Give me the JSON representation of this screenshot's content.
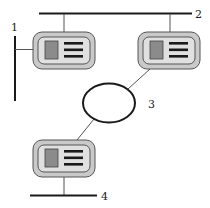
{
  "diagram": {
    "type": "network-topology",
    "labels": {
      "bus_vertical": "1",
      "bus_top": "2",
      "ring": "3",
      "bus_bottom": "4"
    },
    "nodes": [
      {
        "id": "device-top-left",
        "kind": "computer-card",
        "connected_to": [
          "1",
          "2"
        ]
      },
      {
        "id": "device-top-right",
        "kind": "computer-card",
        "connected_to": [
          "2",
          "3"
        ]
      },
      {
        "id": "device-bottom",
        "kind": "computer-card",
        "connected_to": [
          "3",
          "4"
        ]
      }
    ],
    "colors": {
      "line": "#1a1a1a",
      "link": "#555555",
      "card_outer": "#c8c8c8",
      "card_inner": "#dedede",
      "card_border": "#555555",
      "screen": "#8a8a8a"
    }
  }
}
